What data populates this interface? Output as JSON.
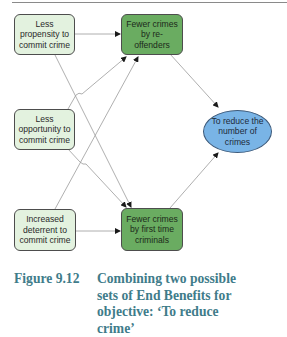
{
  "diagram": {
    "nodes": [
      {
        "id": "less-propensity",
        "type": "cause",
        "label": "Less propensity to commit crime"
      },
      {
        "id": "fewer-reoffenders",
        "type": "end-benefit",
        "label": "Fewer crimes by re-offenders"
      },
      {
        "id": "less-opportunity",
        "type": "cause",
        "label": "Less opportunity to commit crime"
      },
      {
        "id": "objective",
        "type": "objective",
        "label": "To reduce the number of crimes"
      },
      {
        "id": "increased-deterrent",
        "type": "cause",
        "label": "Increased deterrent to commit crime"
      },
      {
        "id": "fewer-first-time",
        "type": "end-benefit",
        "label": "Fewer crimes by first time criminals"
      }
    ],
    "edges": [
      {
        "from": "less-propensity",
        "to": "fewer-reoffenders"
      },
      {
        "from": "less-propensity",
        "to": "fewer-first-time"
      },
      {
        "from": "less-opportunity",
        "to": "fewer-reoffenders"
      },
      {
        "from": "less-opportunity",
        "to": "fewer-first-time"
      },
      {
        "from": "increased-deterrent",
        "to": "fewer-reoffenders"
      },
      {
        "from": "increased-deterrent",
        "to": "fewer-first-time"
      },
      {
        "from": "fewer-reoffenders",
        "to": "objective"
      },
      {
        "from": "fewer-first-time",
        "to": "objective"
      }
    ],
    "colors": {
      "cause_fill": "#e3f2df",
      "end_benefit_fill": "#6aac61",
      "objective_fill": "#79b4e6",
      "border": "#4d4d4d",
      "connector": "#9a9a9a",
      "caption": "#3f7c8a"
    }
  },
  "caption": {
    "label": "Figure 9.12",
    "text": "Combining two possible sets of End Benefits for objective: ‘To reduce crime’"
  }
}
